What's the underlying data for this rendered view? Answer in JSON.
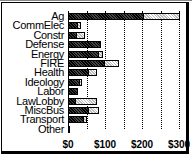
{
  "chart_data": {
    "type": "bar",
    "orientation": "horizontal",
    "stacked": true,
    "title": "",
    "xlabel": "",
    "ylabel": "",
    "xlim": [
      0,
      320
    ],
    "grid": true,
    "categories": [
      "Ag",
      "CommElec",
      "Constr",
      "Defense",
      "Energy",
      "FIRE",
      "Health",
      "Ideology",
      "Labor",
      "LawLobby",
      "MiscBus",
      "Transport",
      "Other"
    ],
    "series": [
      {
        "name": "dark",
        "values": [
          205,
          27,
          25,
          89,
          84,
          100,
          57,
          32,
          27,
          22,
          57,
          43,
          5
        ]
      },
      {
        "name": "light",
        "values": [
          97,
          8,
          21,
          0,
          11,
          38,
          21,
          6,
          0,
          56,
          27,
          8,
          0
        ]
      }
    ],
    "x_ticks": [
      "$0",
      "$100",
      "$200",
      "$300"
    ]
  }
}
